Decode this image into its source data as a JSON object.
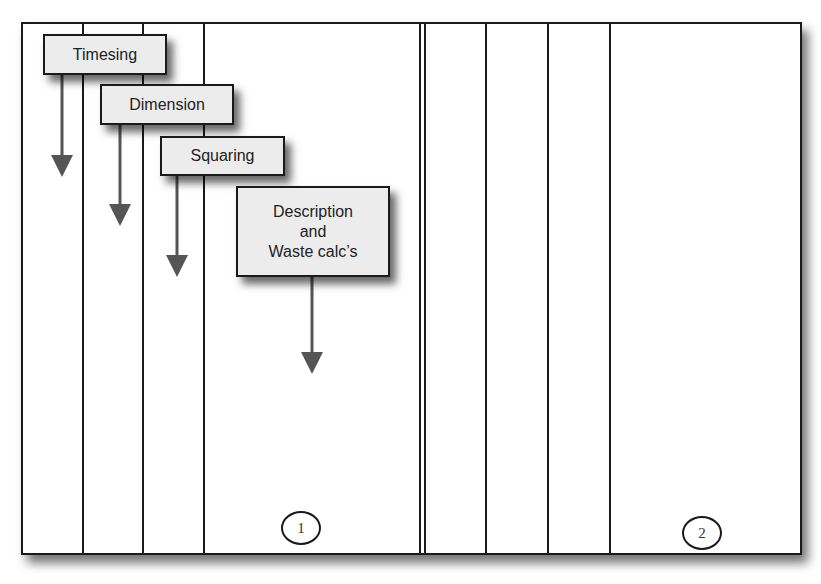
{
  "diagram": {
    "steps": [
      {
        "label": "Timesing"
      },
      {
        "label": "Dimension"
      },
      {
        "label": "Squaring"
      },
      {
        "label_lines": [
          "Description",
          "and",
          "Waste calc’s"
        ]
      }
    ],
    "pages": [
      {
        "number": "1"
      },
      {
        "number": "2"
      }
    ],
    "colors": {
      "box_fill": "#ececec",
      "arrow": "#555555",
      "lines": "#1a1a1a"
    }
  }
}
